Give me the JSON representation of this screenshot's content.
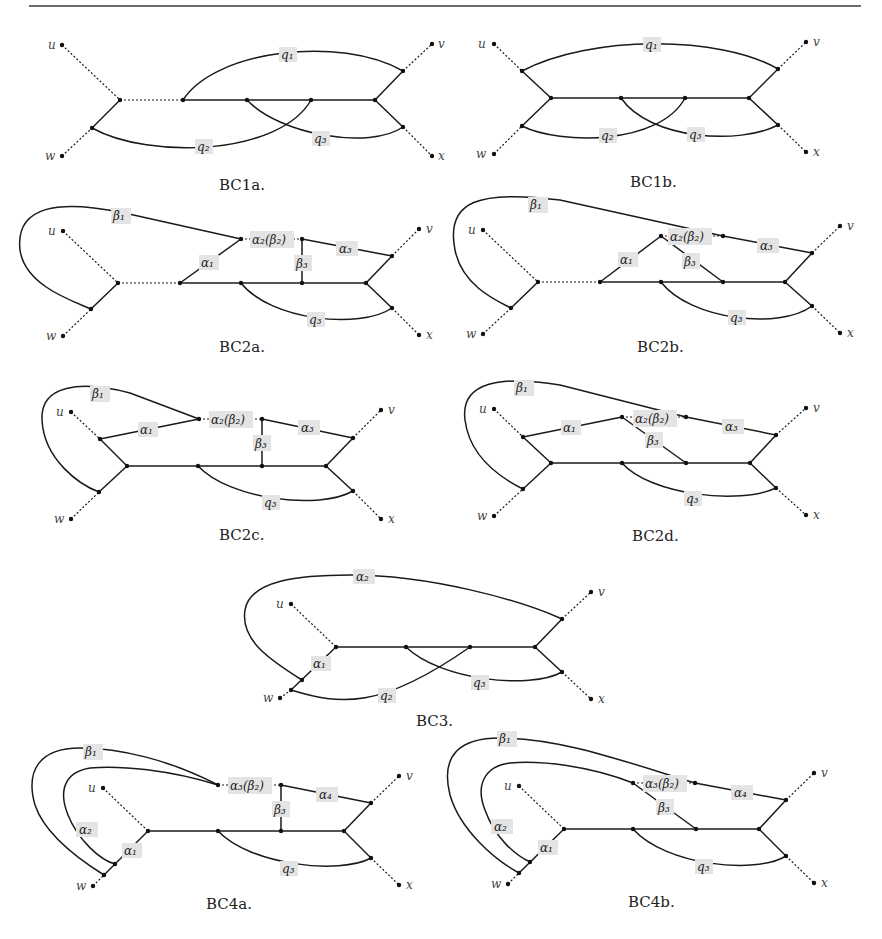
{
  "figure": {
    "terminals": {
      "u": "u",
      "v": "v",
      "w": "w",
      "x": "x"
    },
    "panels": [
      {
        "id": "BC1a",
        "caption": "BC1a.",
        "edge_labels": [
          "q1",
          "q2",
          "q3"
        ]
      },
      {
        "id": "BC1b",
        "caption": "BC1b.",
        "edge_labels": [
          "q1",
          "q2",
          "q3"
        ]
      },
      {
        "id": "BC2a",
        "caption": "BC2a.",
        "edge_labels": [
          "β1",
          "α1",
          "α2(β2)",
          "β3",
          "α3",
          "q3"
        ]
      },
      {
        "id": "BC2b",
        "caption": "BC2b.",
        "edge_labels": [
          "β1",
          "α1",
          "α2(β2)",
          "β3",
          "α3",
          "q3"
        ]
      },
      {
        "id": "BC2c",
        "caption": "BC2c.",
        "edge_labels": [
          "β1",
          "α1",
          "α2(β2)",
          "β3",
          "α3",
          "q3"
        ]
      },
      {
        "id": "BC2d",
        "caption": "BC2d.",
        "edge_labels": [
          "β1",
          "α1",
          "α2(β2)",
          "β3",
          "α3",
          "q3"
        ]
      },
      {
        "id": "BC3",
        "caption": "BC3.",
        "edge_labels": [
          "α2",
          "α1",
          "q2",
          "q3"
        ]
      },
      {
        "id": "BC4a",
        "caption": "BC4a.",
        "edge_labels": [
          "β1",
          "α2",
          "α1",
          "α3(β2)",
          "β3",
          "α4",
          "q3"
        ]
      },
      {
        "id": "BC4b",
        "caption": "BC4b.",
        "edge_labels": [
          "β1",
          "α2",
          "α1",
          "α3(β2)",
          "β3",
          "α4",
          "q3"
        ]
      }
    ]
  },
  "labels": {
    "q1": "q₁",
    "q2": "q₂",
    "q3": "q₃",
    "a1": "α₁",
    "a2": "α₂",
    "a3": "α₃",
    "a4": "α₄",
    "b1": "β₁",
    "b3": "β₃",
    "a2b2": "α₂(β₂)",
    "a3b2": "α₃(β₂)"
  },
  "captions": {
    "bc1a": "BC1a.",
    "bc1b": "BC1b.",
    "bc2a": "BC2a.",
    "bc2b": "BC2b.",
    "bc2c": "BC2c.",
    "bc2d": "BC2d.",
    "bc3": "BC3.",
    "bc4a": "BC4a.",
    "bc4b": "BC4b."
  },
  "terms": {
    "u": "u",
    "v": "v",
    "w": "w",
    "x": "x"
  }
}
